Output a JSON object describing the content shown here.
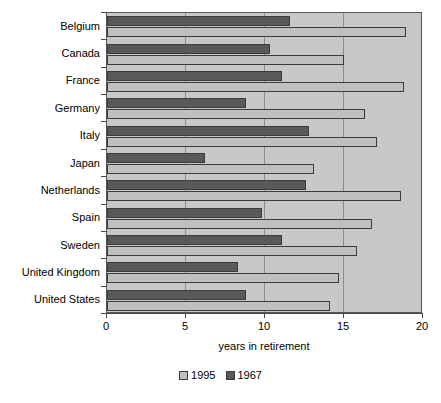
{
  "chart_data": {
    "type": "bar",
    "orientation": "horizontal",
    "title": "",
    "xlabel": "years in retirement",
    "ylabel": "",
    "xlim": [
      0,
      20
    ],
    "xticks": [
      0,
      5,
      10,
      15,
      20
    ],
    "xtick_labels": [
      "0",
      "5",
      "10",
      "15",
      "20"
    ],
    "grid": true,
    "grid_axis": "x",
    "legend_position": "bottom",
    "categories": [
      "Belgium",
      "Canada",
      "France",
      "Germany",
      "Italy",
      "Japan",
      "Netherlands",
      "Spain",
      "Sweden",
      "United Kingdom",
      "United States"
    ],
    "series": [
      {
        "name": "1995",
        "color": "#c0c0c0",
        "values": [
          18.9,
          15.0,
          18.8,
          16.3,
          17.1,
          13.1,
          18.6,
          16.8,
          15.8,
          14.7,
          14.1
        ]
      },
      {
        "name": "1967",
        "color": "#595959",
        "values": [
          11.6,
          10.3,
          11.1,
          8.8,
          12.8,
          6.2,
          12.6,
          9.8,
          11.1,
          8.3,
          8.8
        ]
      }
    ]
  },
  "axis": {
    "x_title": "years in retirement"
  },
  "legend": {
    "entries": [
      {
        "label": "1995",
        "color": "#c0c0c0"
      },
      {
        "label": "1967",
        "color": "#595959"
      }
    ]
  },
  "colors": {
    "plot_background": "#c8c8c8",
    "gridline": "#8d8d8d",
    "axis": "#4a4a4a",
    "bar_border": "#3a3a3a",
    "series_1995": "#c0c0c0",
    "series_1967": "#595959"
  }
}
